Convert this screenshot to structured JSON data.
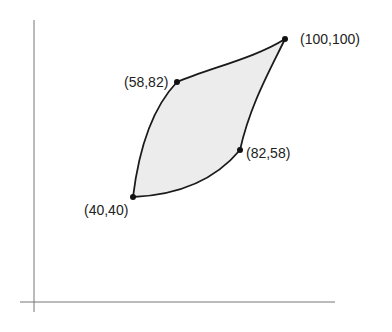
{
  "diagram": {
    "axes": {
      "color": "#777777"
    },
    "region": {
      "fill": "#ececec",
      "stroke": "#1a1a1a"
    },
    "points": [
      {
        "id": "p1",
        "label": "(40,40)"
      },
      {
        "id": "p2",
        "label": "(58,82)"
      },
      {
        "id": "p3",
        "label": "(100,100)"
      },
      {
        "id": "p4",
        "label": "(82,58)"
      }
    ]
  }
}
